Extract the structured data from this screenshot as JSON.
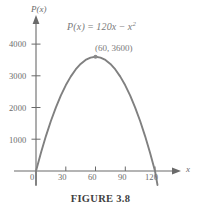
{
  "figure": {
    "caption": "FIGURE 3.8"
  },
  "axes": {
    "y_axis_name": "P(x)",
    "x_axis_name": "x",
    "origin_label": "0"
  },
  "annotations": {
    "equation_fn": "P(x)",
    "equation_eq": "=",
    "equation_term1": "120x",
    "equation_minus": "−",
    "equation_term2": "x",
    "equation_exp": "2",
    "vertex_label": "(60, 3600)"
  },
  "colors": {
    "curve": "#808080",
    "axis": "#6a6a6a",
    "text": "#6e6e6e",
    "caption": "#3f3f3f",
    "background": "#ffffff"
  },
  "chart_data": {
    "type": "line",
    "title": "",
    "subtitle": "",
    "xlabel": "x",
    "ylabel": "P(x)",
    "equation": "P(x) = 120x - x^2",
    "grid": false,
    "legend": "none",
    "xlim": [
      -4,
      135
    ],
    "ylim": [
      -400,
      4400
    ],
    "xticks": [
      0,
      30,
      60,
      90,
      120
    ],
    "xtick_labels": [
      "0",
      "30",
      "60",
      "90",
      "120"
    ],
    "yticks": [
      1000,
      2000,
      3000,
      4000
    ],
    "ytick_labels": [
      "1000",
      "2000",
      "3000",
      "4000"
    ],
    "annotated_points": [
      {
        "x": 60,
        "y": 3600,
        "label": "(60, 3600)",
        "marker": true
      }
    ],
    "series": [
      {
        "name": "P(x) = 120x - x^2",
        "color": "#808080",
        "x": [
          0,
          5,
          10,
          15,
          20,
          25,
          30,
          35,
          40,
          45,
          50,
          55,
          60,
          65,
          70,
          75,
          80,
          85,
          90,
          95,
          100,
          105,
          110,
          115,
          120
        ],
        "values": [
          0,
          575,
          1100,
          1575,
          2000,
          2375,
          2700,
          2975,
          3200,
          3375,
          3500,
          3575,
          3600,
          3575,
          3500,
          3375,
          3200,
          2975,
          2700,
          2375,
          2000,
          1575,
          1100,
          575,
          0
        ]
      }
    ]
  }
}
